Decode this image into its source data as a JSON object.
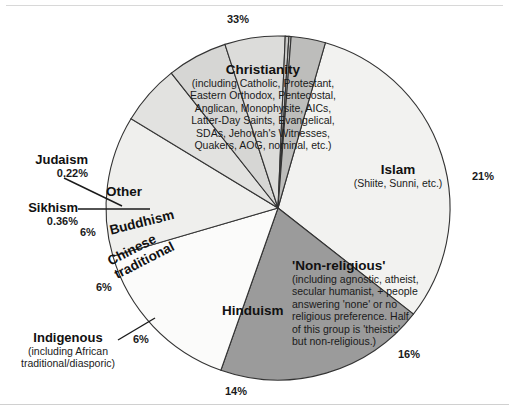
{
  "chart_data": {
    "type": "pie",
    "title": "",
    "legend_position": "in-slice",
    "center": {
      "x": 278,
      "y": 208
    },
    "radius": 172,
    "start_angle_deg": -74,
    "slices": [
      {
        "name": "Christianity",
        "value": 33,
        "pct_label": "33%",
        "sub": "(including Catholic, Protestant, Eastern Orthodox, Pentecostal, Anglican, Monophysite, AICs, Latter-Day Saints, Evangelical, SDAs, Jehovah's Witnesses, Quakers, AOG, nominal, etc.)",
        "color": "#f2f2f0"
      },
      {
        "name": "Islam",
        "value": 21,
        "pct_label": "21%",
        "sub": "(Shiite, Sunni, etc.)",
        "color": "#9b9b9b"
      },
      {
        "name": "'Non-religious'",
        "value": 16,
        "pct_label": "16%",
        "sub": "(including agnostic, atheist, secular humanist, + people answering 'none' or no religious preference. Half of this group is 'theistic' but non-religious.)",
        "color": "#fbfbfa"
      },
      {
        "name": "Hinduism",
        "value": 14,
        "pct_label": "14%",
        "sub": "",
        "color": "#efefed"
      },
      {
        "name": "Indigenous",
        "value": 6,
        "pct_label": "6%",
        "sub": "(including African traditional/diasporic)",
        "color": "#e2e2e0"
      },
      {
        "name": "Chinese traditional",
        "value": 6,
        "pct_label": "6%",
        "sub": "",
        "color": "#d6d6d4"
      },
      {
        "name": "Buddhism",
        "value": 6,
        "pct_label": "6%",
        "sub": "",
        "color": "#dcdcda"
      },
      {
        "name": "Sikhism",
        "value": 0.36,
        "pct_label": "0.36%",
        "sub": "",
        "color": "#c9c9c7"
      },
      {
        "name": "Judaism",
        "value": 0.22,
        "pct_label": "0.22%",
        "sub": "",
        "color": "#c4c4c2"
      },
      {
        "name": "Other",
        "value": 3.42,
        "pct_label": "",
        "sub": "",
        "color": "#bdbdbb"
      }
    ],
    "xlabel": "",
    "ylabel": ""
  },
  "labels": {
    "christianity_title": "Christianity",
    "christianity_sub_lines": [
      "(including Catholic, Protestant,",
      "Eastern Orthodox, Pentecostal,",
      "Anglican, Monophysite, AICs,",
      "Latter-Day Saints, Evangelical,",
      "SDAs, Jehovah's Witnesses,",
      "Quakers, AOG, nominal, etc.)"
    ],
    "islam_title": "Islam",
    "islam_sub": "(Shiite, Sunni, etc.)",
    "nonreligious_title": "'Non-religious'",
    "nonreligious_sub_lines": [
      "(including agnostic, atheist,",
      "secular humanist, + people",
      "answering 'none' or no",
      "religious preference. Half",
      "of this group is 'theistic'",
      "but non-religious.)"
    ],
    "hinduism_title": "Hinduism",
    "other_title": "Other",
    "buddhism_title": "Buddhism",
    "chinese_line1": "Chinese",
    "chinese_line2": "traditional",
    "indigenous_title": "Indigenous",
    "indigenous_sub_line1": "(including African",
    "indigenous_sub_line2": "traditional/diasporic)",
    "judaism_title": "Judaism",
    "judaism_pct": "0.22%",
    "sikhism_title": "Sikhism",
    "sikhism_pct": "0.36%"
  },
  "percent_labels": {
    "christianity": "33%",
    "islam": "21%",
    "nonreligious": "16%",
    "hinduism": "14%",
    "indigenous": "6%",
    "chinese": "6%",
    "buddhism": "6%"
  },
  "colors": {
    "outline": "#333333",
    "islam_fill": "#9b9b9b",
    "other_fill": "#bdbdbb",
    "background": "#ffffff"
  }
}
